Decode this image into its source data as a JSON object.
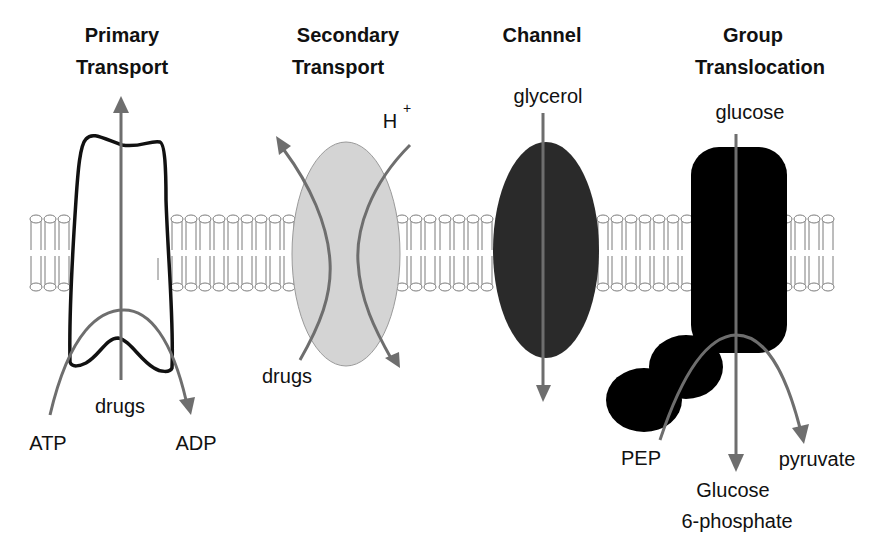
{
  "diagram": {
    "type": "membrane-transport-mechanisms",
    "colors": {
      "arrow": "#6e6e6e",
      "lipid": "#7a7a7a",
      "secondary_protein": "#d4d4d4",
      "channel_protein": "#2a2a2a",
      "group_protein": "#000000",
      "primary_outline": "#111111",
      "text": "#111111"
    },
    "panels": [
      {
        "id": "primary",
        "title_line1": "Primary",
        "title_line2": "Transport",
        "labels": {
          "substrate": "drugs",
          "input": "ATP",
          "output": "ADP"
        }
      },
      {
        "id": "secondary",
        "title_line1": "Secondary",
        "title_line2": "Transport",
        "labels": {
          "coupled_ion": "H",
          "ion_charge": "+",
          "substrate": "drugs"
        }
      },
      {
        "id": "channel",
        "title_line1": "Channel",
        "labels": {
          "substrate": "glycerol"
        }
      },
      {
        "id": "group",
        "title_line1": "Group",
        "title_line2": "Translocation",
        "labels": {
          "substrate": "glucose",
          "donor": "PEP",
          "byproduct": "pyruvate",
          "product_line1": "Glucose",
          "product_line2": "6-phosphate"
        }
      }
    ]
  }
}
